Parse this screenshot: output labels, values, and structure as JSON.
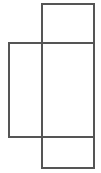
{
  "figure": {
    "canvas": {
      "width": 101,
      "height": 173,
      "background_color": "#ffffff"
    },
    "style": {
      "stroke_color": "#555555",
      "stroke_width": 1.5,
      "fill": "none"
    },
    "shapes": [
      {
        "name": "vertical-rectangle",
        "label": "Tall vertical rectangle",
        "x": 42,
        "y": 4,
        "width": 52,
        "height": 164
      },
      {
        "name": "horizontal-rectangle",
        "label": "Wide horizontal rectangle",
        "x": 9,
        "y": 43,
        "width": 85,
        "height": 94
      }
    ]
  }
}
